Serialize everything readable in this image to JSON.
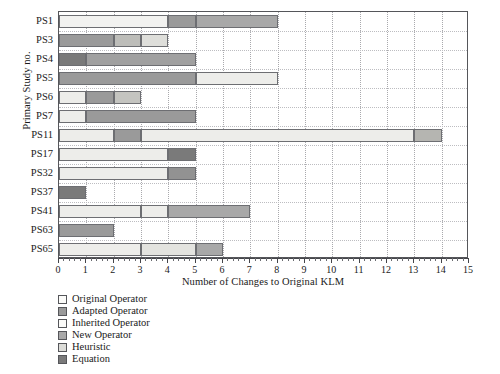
{
  "chart_data": {
    "type": "bar",
    "orientation": "horizontal",
    "stacked": true,
    "title": "",
    "xlabel": "Number of Changes to Original KLM",
    "ylabel": "Primary Study no.",
    "xlim": [
      0,
      15
    ],
    "xticks": [
      0,
      1,
      2,
      3,
      4,
      5,
      6,
      7,
      8,
      9,
      10,
      11,
      12,
      13,
      14,
      15
    ],
    "xtick_labels": [
      "0",
      "1",
      "2",
      "3",
      "4",
      "5",
      "6",
      "7",
      "8",
      "9",
      "10",
      "11",
      "12",
      "13",
      "14",
      "15"
    ],
    "grid": true,
    "legend_position": "below-left",
    "categories": [
      "PS1",
      "PS3",
      "PS4",
      "PS5",
      "PS6",
      "PS7",
      "PS11",
      "PS17",
      "PS32",
      "PS37",
      "PS41",
      "PS63",
      "PS65"
    ],
    "series": [
      {
        "name": "Original Operator",
        "color": "#f2f2f0",
        "values": [
          4,
          1,
          0,
          0,
          1,
          1,
          2,
          4,
          4,
          0,
          3,
          0,
          3
        ]
      },
      {
        "name": "Adapted Operator",
        "color": "#9a9a9a",
        "values": [
          1,
          2,
          0,
          5,
          1,
          4,
          0,
          0,
          0,
          0,
          0,
          2,
          0
        ]
      },
      {
        "name": "Inherited Operator",
        "color": "#ededea",
        "values": [
          0,
          0,
          0,
          0,
          0,
          0,
          10,
          0,
          0,
          0,
          1,
          0,
          0
        ]
      },
      {
        "name": "New Operator",
        "color": "#a8a8a8",
        "values": [
          3,
          0,
          4,
          0,
          0,
          0,
          1,
          0,
          1,
          0,
          3,
          0,
          3
        ]
      },
      {
        "name": "Heuristic",
        "color": "#d6d6d2",
        "values": [
          0,
          1,
          0,
          3,
          1,
          0,
          0,
          0,
          0,
          0,
          0,
          0,
          0
        ]
      },
      {
        "name": "Equation",
        "color": "#7a7a7a",
        "values": [
          0,
          0,
          1,
          0,
          0,
          0,
          1,
          1,
          0,
          1,
          0,
          0,
          0
        ]
      }
    ],
    "bars": [
      {
        "category": "PS1",
        "total": 8,
        "segments": [
          {
            "series": "Original Operator",
            "start": 0,
            "end": 4,
            "color": "#f2f2f0"
          },
          {
            "series": "Adapted Operator",
            "start": 4,
            "end": 5,
            "color": "#9a9a9a"
          },
          {
            "series": "New Operator",
            "start": 5,
            "end": 8,
            "color": "#a8a8a8"
          }
        ]
      },
      {
        "category": "PS3",
        "total": 4,
        "segments": [
          {
            "series": "Adapted Operator",
            "start": 0,
            "end": 2,
            "color": "#9a9a9a"
          },
          {
            "series": "Heuristic",
            "start": 2,
            "end": 3,
            "color": "#bdbdb9"
          },
          {
            "series": "Original Operator",
            "start": 3,
            "end": 4,
            "color": "#dededa"
          }
        ]
      },
      {
        "category": "PS4",
        "total": 5,
        "segments": [
          {
            "series": "Equation",
            "start": 0,
            "end": 1,
            "color": "#7a7a7a"
          },
          {
            "series": "New Operator",
            "start": 1,
            "end": 5,
            "color": "#a0a0a0"
          }
        ]
      },
      {
        "category": "PS5",
        "total": 8,
        "segments": [
          {
            "series": "Adapted Operator",
            "start": 0,
            "end": 5,
            "color": "#9a9a9a"
          },
          {
            "series": "Heuristic",
            "start": 5,
            "end": 8,
            "color": "#ededea"
          }
        ]
      },
      {
        "category": "PS6",
        "total": 3,
        "segments": [
          {
            "series": "Original Operator",
            "start": 0,
            "end": 1,
            "color": "#ededea"
          },
          {
            "series": "Adapted Operator",
            "start": 1,
            "end": 2,
            "color": "#9a9a9a"
          },
          {
            "series": "Heuristic",
            "start": 2,
            "end": 3,
            "color": "#c4c4c0"
          }
        ]
      },
      {
        "category": "PS7",
        "total": 5,
        "segments": [
          {
            "series": "Original Operator",
            "start": 0,
            "end": 1,
            "color": "#ededea"
          },
          {
            "series": "Adapted Operator",
            "start": 1,
            "end": 5,
            "color": "#9a9a9a"
          }
        ]
      },
      {
        "category": "PS11",
        "total": 14,
        "segments": [
          {
            "series": "Original Operator",
            "start": 0,
            "end": 2,
            "color": "#ededea"
          },
          {
            "series": "Adapted Operator",
            "start": 2,
            "end": 3,
            "color": "#9a9a9a"
          },
          {
            "series": "Inherited Operator",
            "start": 3,
            "end": 13,
            "color": "#ededea"
          },
          {
            "series": "New Operator",
            "start": 13,
            "end": 14,
            "color": "#b5b5b1"
          }
        ]
      },
      {
        "category": "PS17",
        "total": 5,
        "segments": [
          {
            "series": "Original Operator",
            "start": 0,
            "end": 4,
            "color": "#ededea"
          },
          {
            "series": "Equation",
            "start": 4,
            "end": 5,
            "color": "#7a7a7a"
          }
        ]
      },
      {
        "category": "PS32",
        "total": 5,
        "segments": [
          {
            "series": "Original Operator",
            "start": 0,
            "end": 4,
            "color": "#ededea"
          },
          {
            "series": "New Operator",
            "start": 4,
            "end": 5,
            "color": "#929292"
          }
        ]
      },
      {
        "category": "PS37",
        "total": 1,
        "segments": [
          {
            "series": "Equation",
            "start": 0,
            "end": 1,
            "color": "#7a7a7a"
          }
        ]
      },
      {
        "category": "PS41",
        "total": 7,
        "segments": [
          {
            "series": "Original Operator",
            "start": 0,
            "end": 3,
            "color": "#ededea"
          },
          {
            "series": "Inherited Operator",
            "start": 3,
            "end": 4,
            "color": "#ededea"
          },
          {
            "series": "New Operator",
            "start": 4,
            "end": 7,
            "color": "#a8a8a8"
          }
        ]
      },
      {
        "category": "PS63",
        "total": 2,
        "segments": [
          {
            "series": "Adapted Operator",
            "start": 0,
            "end": 2,
            "color": "#9a9a9a"
          }
        ]
      },
      {
        "category": "PS65",
        "total": 6,
        "segments": [
          {
            "series": "Original Operator",
            "start": 0,
            "end": 3,
            "color": "#ededea"
          },
          {
            "series": "Inherited Operator",
            "start": 3,
            "end": 5,
            "color": "#e3e3df"
          },
          {
            "series": "New Operator",
            "start": 5,
            "end": 6,
            "color": "#a8a8a8"
          }
        ]
      }
    ],
    "legend": [
      {
        "label": "Original Operator",
        "color": "#fbfbf9"
      },
      {
        "label": "Adapted Operator",
        "color": "#9a9a9a"
      },
      {
        "label": "Inherited Operator",
        "color": "#fbfbf9"
      },
      {
        "label": "New Operator",
        "color": "#a8a8a8"
      },
      {
        "label": "Heuristic",
        "color": "#dcdcd8"
      },
      {
        "label": "Equation",
        "color": "#7a7a7a"
      }
    ]
  }
}
